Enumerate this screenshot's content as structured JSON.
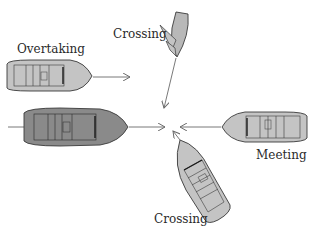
{
  "diagram": {
    "labels": {
      "overtaking": "Overtaking",
      "crossing_top": "Crossing",
      "meeting": "Meeting",
      "crossing_bottom": "Crossing"
    },
    "colors": {
      "light_hull": "#c4c4c4",
      "dark_hull": "#8a8a8a",
      "sail": "#b8b8b8",
      "outline": "#3a3a3a",
      "arrow": "#6a6a6a"
    },
    "center_point": {
      "x": 172,
      "y": 128
    }
  }
}
